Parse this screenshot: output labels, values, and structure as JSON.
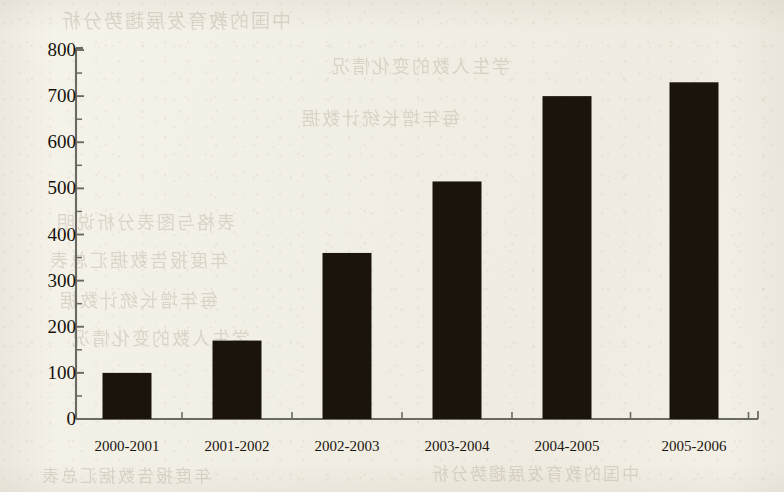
{
  "page": {
    "background_color": "#f3f0e7",
    "media": "scanned-book-page",
    "ghost_text_color": "#b9b0a0",
    "ghost_lines": [
      "中国的教育发展趨势分析",
      "学生人数的变化情况",
      "每年增长统计数据",
      "表格与图表分析说明",
      "年度报告数据汇总表"
    ]
  },
  "chart_data": {
    "type": "bar",
    "title": "",
    "subtitle": "",
    "xlabel": "",
    "ylabel": "",
    "categories": [
      "2000-2001",
      "2001-2002",
      "2002-2003",
      "2003-2004",
      "2004-2005",
      "2005-2006"
    ],
    "values": [
      100,
      170,
      360,
      515,
      700,
      730
    ],
    "series": [
      {
        "name": "",
        "values": [
          100,
          170,
          360,
          515,
          700,
          730
        ]
      }
    ],
    "ylim": [
      0,
      800
    ],
    "ytick_major_step": 100,
    "ytick_minor_step": 50,
    "ytick_labels": [
      "0",
      "100",
      "200",
      "300",
      "400",
      "500",
      "600",
      "700",
      "800"
    ],
    "ytick_values": [
      0,
      100,
      200,
      300,
      400,
      500,
      600,
      700,
      800
    ],
    "grid": false,
    "legend": "none",
    "bar_color": "#1b140d",
    "axis_color": "#6b6a62",
    "label_color": "#17120c"
  },
  "geometry": {
    "plot_left": 76,
    "plot_right": 758,
    "plot_top": 50,
    "plot_bottom": 419,
    "bar_width": 49,
    "bar_centers": [
      127,
      237,
      347,
      457,
      567,
      694
    ]
  }
}
